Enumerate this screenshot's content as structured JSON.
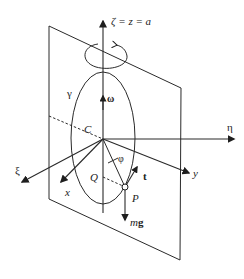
{
  "figure": {
    "axis_labels": {
      "zeta": "ζ = z = a",
      "eta": "η",
      "xi": "ξ",
      "x": "x",
      "y": "y"
    },
    "curve_label": "γ",
    "angular_velocity_label": "ω",
    "center_label": "C",
    "angle_label": "φ",
    "point_labels": {
      "P": "P",
      "Q": "Q"
    },
    "vector_labels": {
      "tangent": "t",
      "weight_m": "m",
      "weight_g": "g"
    },
    "icons": {
      "rotation": "rotation-arrow-icon",
      "point": "point-circle-icon"
    },
    "colors": {
      "stroke": "#2a2a2a",
      "text": "#222222",
      "background": "#ffffff"
    }
  }
}
